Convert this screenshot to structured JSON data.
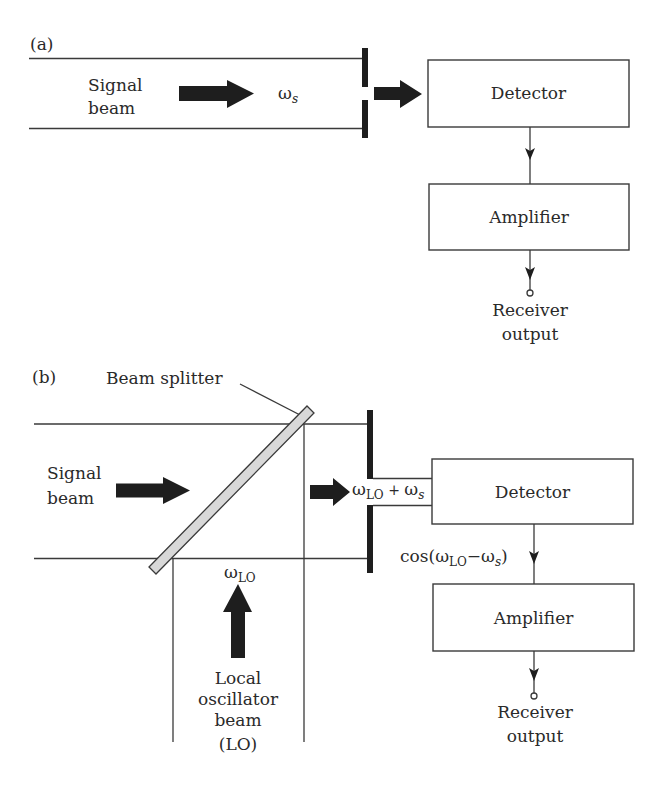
{
  "panel_a": {
    "label": "(a)",
    "signal_beam": [
      "Signal",
      "beam"
    ],
    "signal_freq": {
      "symbol": "ω",
      "sub": "s"
    },
    "detector": "Detector",
    "amplifier": "Amplifier",
    "output": [
      "Receiver",
      "output"
    ]
  },
  "panel_b": {
    "label": "(b)",
    "beam_splitter": "Beam splitter",
    "signal_beam": [
      "Signal",
      "beam"
    ],
    "mixed_freq": {
      "symbol1": "ω",
      "sub1": "LO",
      "plus": " + ",
      "symbol2": "ω",
      "sub2": "s"
    },
    "lo_freq": {
      "symbol": "ω",
      "sub": "LO"
    },
    "lo_beam": [
      "Local",
      "oscillator",
      "beam",
      "(LO)"
    ],
    "detector": "Detector",
    "beat_signal": {
      "prefix": "cos(",
      "symbol1": "ω",
      "sub1": "LO",
      "minus": "−",
      "symbol2": "ω",
      "sub2": "s",
      "suffix": ")"
    },
    "amplifier": "Amplifier",
    "output": [
      "Receiver",
      "output"
    ]
  },
  "colors": {
    "line": "#3a3a3a",
    "arrow": "#1e1e1e",
    "splitter_fill": "#d8d8d8",
    "text": "#2a2a2a"
  }
}
